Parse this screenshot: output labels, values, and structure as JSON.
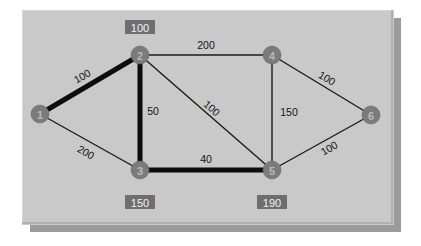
{
  "diagram": {
    "panel_color": "#c9c9c9",
    "panel_shadow_color": "#9b9b9b",
    "node_color": "#7b7b7b",
    "node_text_color": "#b9b9b9",
    "edge_color": "#1a1a1a",
    "highlight_edge_color": "#0d0d0d",
    "distance_box_color": "#6e6e6e",
    "distance_text_color": "#f2f2f2"
  },
  "chart_data": {
    "type": "diagram",
    "title": "",
    "nodes": [
      {
        "id": "1",
        "label": "1",
        "x": 40,
        "y": 114
      },
      {
        "id": "2",
        "label": "2",
        "x": 140,
        "y": 55
      },
      {
        "id": "3",
        "label": "3",
        "x": 140,
        "y": 170
      },
      {
        "id": "4",
        "label": "4",
        "x": 272,
        "y": 55
      },
      {
        "id": "5",
        "label": "5",
        "x": 272,
        "y": 170
      },
      {
        "id": "6",
        "label": "6",
        "x": 371,
        "y": 115
      }
    ],
    "edges": [
      {
        "from": "1",
        "to": "2",
        "weight": "100",
        "highlighted": true,
        "label_x": 82,
        "label_y": 76,
        "rotate": -30
      },
      {
        "from": "1",
        "to": "3",
        "weight": "200",
        "highlighted": false,
        "label_x": 86,
        "label_y": 152,
        "rotate": 29
      },
      {
        "from": "2",
        "to": "3",
        "weight": "50",
        "highlighted": true,
        "label_x": 153,
        "label_y": 111,
        "rotate": 0
      },
      {
        "from": "2",
        "to": "4",
        "weight": "200",
        "highlighted": false,
        "label_x": 206,
        "label_y": 45,
        "rotate": 0
      },
      {
        "from": "2",
        "to": "5",
        "weight": "100",
        "highlighted": false,
        "label_x": 212,
        "label_y": 108,
        "rotate": 41
      },
      {
        "from": "3",
        "to": "5",
        "weight": "40",
        "highlighted": true,
        "label_x": 206,
        "label_y": 159,
        "rotate": 0
      },
      {
        "from": "4",
        "to": "5",
        "weight": "150",
        "highlighted": false,
        "label_x": 289,
        "label_y": 112,
        "rotate": 0
      },
      {
        "from": "4",
        "to": "6",
        "weight": "100",
        "highlighted": false,
        "label_x": 327,
        "label_y": 78,
        "rotate": 31
      },
      {
        "from": "5",
        "to": "6",
        "weight": "100",
        "highlighted": false,
        "label_x": 329,
        "label_y": 148,
        "rotate": -30
      }
    ],
    "distance_labels": [
      {
        "node": "2",
        "value": "100",
        "x": 140,
        "y": 27
      },
      {
        "node": "3",
        "value": "150",
        "x": 140,
        "y": 202
      },
      {
        "node": "5",
        "value": "190",
        "x": 272,
        "y": 202
      }
    ],
    "legend": [],
    "annotations": []
  }
}
